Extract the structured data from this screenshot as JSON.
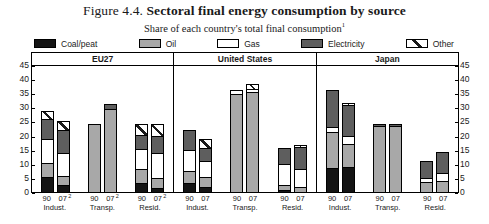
{
  "title": {
    "lead": "Figure 4.4.",
    "bold": "Sectoral final energy consumption by source",
    "subtitle": "Share of each country's total final consumption",
    "subtitle_note": "1"
  },
  "legend": {
    "items": [
      {
        "label": "Coal/peat",
        "icon": "coal-swatch",
        "color": "#141414"
      },
      {
        "label": "Oil",
        "icon": "oil-swatch",
        "color": "#a8a8a8"
      },
      {
        "label": "Gas",
        "icon": "gas-swatch",
        "color": "#ffffff"
      },
      {
        "label": "Electricity",
        "icon": "electricity-swatch",
        "color": "#5e5e5e"
      },
      {
        "label": "Other",
        "icon": "other-swatch",
        "color": "#ffffff"
      }
    ]
  },
  "axis": {
    "ticks": [
      "45",
      "40",
      "35",
      "30",
      "25",
      "20",
      "15",
      "10",
      "5",
      "0"
    ],
    "min": 0,
    "max": 45
  },
  "chart_data": {
    "type": "bar",
    "subtype": "stacked",
    "title": "Figure 4.4. Sectoral final energy consumption by source",
    "subtitle": "Share of each country's total final consumption",
    "xlabel": "",
    "ylabel": "",
    "ylim": [
      0,
      45
    ],
    "yticks": [
      0,
      5,
      10,
      15,
      20,
      25,
      30,
      35,
      40,
      45
    ],
    "grid": false,
    "legend_position": "top",
    "series": [
      {
        "name": "Coal/peat",
        "key": "coal",
        "color": "#141414"
      },
      {
        "name": "Oil",
        "key": "oil",
        "color": "#a8a8a8"
      },
      {
        "name": "Gas",
        "key": "gas",
        "color": "#ffffff"
      },
      {
        "name": "Electricity",
        "key": "elec",
        "color": "#5e5e5e"
      },
      {
        "name": "Other",
        "key": "other",
        "color": "#ffffff"
      }
    ],
    "panels": [
      {
        "name": "EU27",
        "groups": [
          {
            "sector": "Indust.",
            "bars": [
              {
                "year": "90",
                "note": "",
                "total": 29.0,
                "values": {
                  "coal": 5.5,
                  "oil": 5.0,
                  "gas": 8.5,
                  "elec": 7.5,
                  "other": 2.5
                }
              },
              {
                "year": "07",
                "note": "2",
                "total": 25.5,
                "values": {
                  "coal": 2.5,
                  "oil": 3.0,
                  "gas": 8.5,
                  "elec": 8.5,
                  "other": 3.0
                }
              }
            ]
          },
          {
            "sector": "Transp.",
            "bars": [
              {
                "year": "90",
                "note": "",
                "total": 24.5,
                "values": {
                  "coal": 0.0,
                  "oil": 24.5,
                  "gas": 0.0,
                  "elec": 0.0,
                  "other": 0.0
                }
              },
              {
                "year": "07",
                "note": "2",
                "total": 31.5,
                "values": {
                  "coal": 0.0,
                  "oil": 30.0,
                  "gas": 0.0,
                  "elec": 1.5,
                  "other": 0.0
                }
              }
            ]
          },
          {
            "sector": "Resid.",
            "bars": [
              {
                "year": "90",
                "note": "",
                "total": 24.5,
                "values": {
                  "coal": 3.0,
                  "oil": 5.0,
                  "gas": 7.5,
                  "elec": 5.0,
                  "other": 4.0
                }
              },
              {
                "year": "07",
                "note": "2",
                "total": 24.5,
                "values": {
                  "coal": 1.0,
                  "oil": 3.5,
                  "gas": 9.5,
                  "elec": 6.0,
                  "other": 4.5
                }
              }
            ]
          }
        ]
      },
      {
        "name": "United States",
        "groups": [
          {
            "sector": "Indust.",
            "bars": [
              {
                "year": "90",
                "total": 22.5,
                "values": {
                  "coal": 3.0,
                  "oil": 4.5,
                  "gas": 7.5,
                  "elec": 7.5,
                  "other": 0.0
                }
              },
              {
                "year": "07",
                "total": 19.0,
                "values": {
                  "coal": 1.5,
                  "oil": 3.5,
                  "gas": 6.0,
                  "elec": 5.0,
                  "other": 3.0
                }
              }
            ]
          },
          {
            "sector": "Transp.",
            "bars": [
              {
                "year": "90",
                "total": 36.5,
                "values": {
                  "coal": 0.0,
                  "oil": 35.5,
                  "gas": 1.0,
                  "elec": 0.0,
                  "other": 0.0
                }
              },
              {
                "year": "07",
                "total": 38.5,
                "values": {
                  "coal": 0.0,
                  "oil": 36.5,
                  "gas": 0.5,
                  "elec": 0.0,
                  "other": 1.5
                }
              }
            ]
          },
          {
            "sector": "Resid.",
            "bars": [
              {
                "year": "90",
                "total": 16.0,
                "values": {
                  "coal": 0.5,
                  "oil": 1.5,
                  "gas": 8.0,
                  "elec": 6.0,
                  "other": 0.0
                }
              },
              {
                "year": "07",
                "total": 17.0,
                "values": {
                  "coal": 0.0,
                  "oil": 1.5,
                  "gas": 7.0,
                  "elec": 8.0,
                  "other": 0.5
                }
              }
            ]
          }
        ]
      },
      {
        "name": "Japan",
        "groups": [
          {
            "sector": "Indust.",
            "bars": [
              {
                "year": "90",
                "total": 36.5,
                "values": {
                  "coal": 8.5,
                  "oil": 13.0,
                  "gas": 1.5,
                  "elec": 13.5,
                  "other": 0.0
                }
              },
              {
                "year": "07",
                "total": 32.0,
                "values": {
                  "coal": 9.0,
                  "oil": 8.5,
                  "gas": 2.5,
                  "elec": 11.5,
                  "other": 0.5
                }
              }
            ]
          },
          {
            "sector": "Transp.",
            "bars": [
              {
                "year": "90",
                "total": 24.5,
                "values": {
                  "coal": 0.0,
                  "oil": 24.0,
                  "gas": 0.0,
                  "elec": 0.5,
                  "other": 0.0
                }
              },
              {
                "year": "07",
                "total": 24.5,
                "values": {
                  "coal": 0.0,
                  "oil": 24.0,
                  "gas": 0.0,
                  "elec": 0.5,
                  "other": 0.0
                }
              }
            ]
          },
          {
            "sector": "Resid.",
            "bars": [
              {
                "year": "90",
                "total": 11.5,
                "values": {
                  "coal": 0.0,
                  "oil": 3.5,
                  "gas": 1.5,
                  "elec": 6.5,
                  "other": 0.0
                }
              },
              {
                "year": "07",
                "total": 14.5,
                "values": {
                  "coal": 0.0,
                  "oil": 4.0,
                  "gas": 2.5,
                  "elec": 8.0,
                  "other": 0.0
                }
              }
            ]
          }
        ]
      }
    ]
  }
}
